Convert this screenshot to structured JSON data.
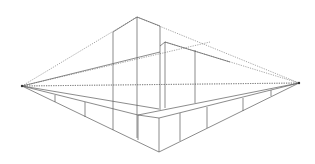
{
  "diagram": {
    "type": "two-point-perspective",
    "colors": {
      "background": "#ffffff",
      "line": "#5a5a5a",
      "guide": "#6a6a6a"
    },
    "vanishing_points": {
      "left": [
        22,
        86
      ],
      "right": [
        299,
        83
      ]
    },
    "horizon_y": 85
  }
}
